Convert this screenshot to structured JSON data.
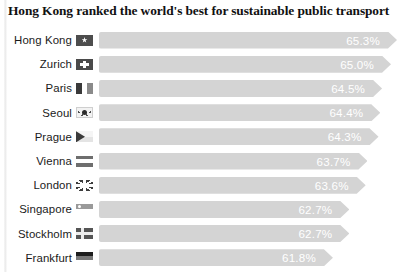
{
  "title": "Hong Kong ranked the world's best for sustainable public transport",
  "colors": {
    "bar": "#d4d4d4",
    "value_text": "#ffffff",
    "label_text": "#1a1a1a",
    "background": "#ffffff"
  },
  "chart_data": {
    "type": "bar",
    "orientation": "horizontal",
    "title": "Hong Kong ranked the world's best for sustainable public transport",
    "xlabel": "",
    "ylabel": "",
    "grid": false,
    "legend": false,
    "value_suffix": "%",
    "categories": [
      "Hong Kong",
      "Zurich",
      "Paris",
      "Seoul",
      "Prague",
      "Vienna",
      "London",
      "Singapore",
      "Stockholm",
      "Frankfurt"
    ],
    "values": [
      65.3,
      65.0,
      64.5,
      64.4,
      64.3,
      63.7,
      63.6,
      62.7,
      62.7,
      61.8
    ],
    "value_labels": [
      "65.3%",
      "65.0%",
      "64.5%",
      "64.4%",
      "64.3%",
      "63.7%",
      "63.6%",
      "62.7%",
      "62.7%",
      "61.8%"
    ],
    "xlim": [
      0,
      66
    ]
  },
  "rows": [
    {
      "label": "Hong Kong",
      "value": "65.3%",
      "flag": "flag-hong-kong",
      "flag_class": "f-hongkong",
      "bar_pct": 100.0
    },
    {
      "label": "Zurich",
      "value": "65.0%",
      "flag": "flag-switzerland",
      "flag_class": "f-zurich",
      "bar_pct": 98.0
    },
    {
      "label": "Paris",
      "value": "64.5%",
      "flag": "flag-france",
      "flag_class": "f-paris",
      "bar_pct": 95.0
    },
    {
      "label": "Seoul",
      "value": "64.4%",
      "flag": "flag-south-korea",
      "flag_class": "f-seoul",
      "bar_pct": 94.4
    },
    {
      "label": "Prague",
      "value": "64.3%",
      "flag": "flag-czechia",
      "flag_class": "f-prague",
      "bar_pct": 93.8
    },
    {
      "label": "Vienna",
      "value": "63.7%",
      "flag": "flag-austria",
      "flag_class": "f-vienna",
      "bar_pct": 90.1
    },
    {
      "label": "London",
      "value": "63.6%",
      "flag": "flag-united-kingdom",
      "flag_class": "f-london",
      "bar_pct": 89.5
    },
    {
      "label": "Singapore",
      "value": "62.7%",
      "flag": "flag-singapore",
      "flag_class": "f-singapore",
      "bar_pct": 84.0
    },
    {
      "label": "Stockholm",
      "value": "62.7%",
      "flag": "flag-sweden",
      "flag_class": "f-stockholm",
      "bar_pct": 84.0
    },
    {
      "label": "Frankfurt",
      "value": "61.8%",
      "flag": "flag-germany",
      "flag_class": "f-frankfurt",
      "bar_pct": 78.5
    }
  ]
}
